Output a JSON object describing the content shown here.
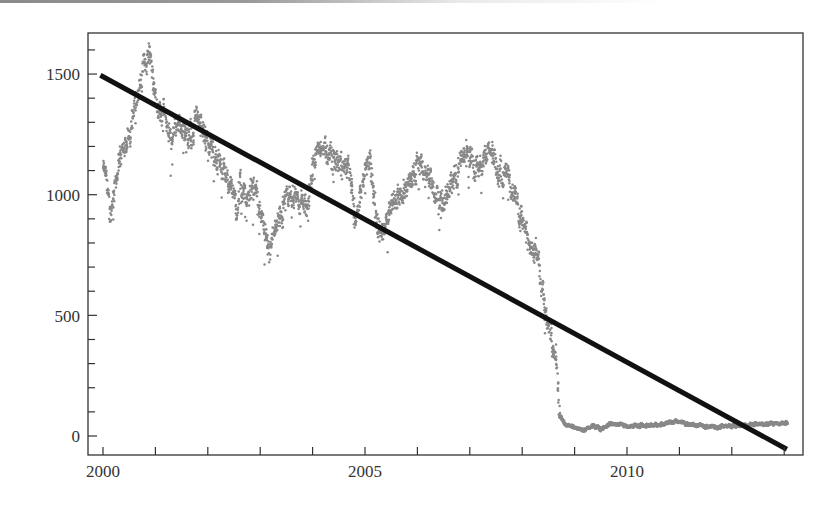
{
  "chart_data": {
    "type": "scatter",
    "title": "",
    "xlabel": "",
    "ylabel": "",
    "xlim": [
      1999.7,
      2013.3
    ],
    "ylim": [
      -90,
      1680
    ],
    "x_ticks": {
      "major": [
        2000,
        2005,
        2010
      ],
      "major_labels": [
        "2000",
        "2005",
        "2010"
      ],
      "minor": [
        2000,
        2001,
        2002,
        2003,
        2004,
        2005,
        2006,
        2007,
        2008,
        2009,
        2010,
        2011,
        2012,
        2013
      ]
    },
    "y_ticks": {
      "major": [
        0,
        500,
        1000,
        1500
      ],
      "major_labels": [
        "0",
        "500",
        "1000",
        "1500"
      ],
      "minor": [
        0,
        100,
        200,
        300,
        400,
        500,
        600,
        700,
        800,
        900,
        1000,
        1100,
        1200,
        1300,
        1400,
        1500,
        1600
      ]
    },
    "grid": false,
    "legend": null,
    "series": [
      {
        "name": "observed",
        "kind": "scatter",
        "color": "#888888",
        "x": [
          2000.0,
          2000.08,
          2000.13,
          2000.19,
          2000.29,
          2000.46,
          2000.55,
          2000.61,
          2000.71,
          2000.8,
          2000.9,
          2000.95,
          2001.03,
          2001.18,
          2001.28,
          2001.43,
          2001.56,
          2001.7,
          2001.76,
          2001.89,
          2002.04,
          2002.18,
          2002.29,
          2002.42,
          2002.56,
          2002.61,
          2002.75,
          2002.84,
          2003.0,
          2003.15,
          2003.38,
          2003.57,
          2003.76,
          2003.91,
          2004.01,
          2004.24,
          2004.39,
          2004.58,
          2004.71,
          2004.81,
          2004.96,
          2005.1,
          2005.19,
          2005.29,
          2005.44,
          2005.53,
          2005.73,
          2005.86,
          2005.99,
          2006.11,
          2006.28,
          2006.37,
          2006.49,
          2006.62,
          2006.76,
          2006.87,
          2006.97,
          2007.14,
          2007.23,
          2007.35,
          2007.44,
          2007.54,
          2007.67,
          2007.73,
          2007.81,
          2007.9,
          2008.02,
          2008.15,
          2008.28,
          2008.38,
          2008.47,
          2008.57,
          2008.66,
          2008.72,
          2008.82,
          2009.16,
          2009.35,
          2009.52,
          2009.68,
          2010.06,
          2010.44,
          2010.97,
          2011.26,
          2011.72,
          2012.21,
          2012.67,
          2013.07
        ],
        "y": [
          1100,
          1050,
          900,
          1000,
          1130,
          1230,
          1290,
          1370,
          1460,
          1550,
          1600,
          1520,
          1380,
          1330,
          1230,
          1310,
          1260,
          1220,
          1330,
          1280,
          1200,
          1150,
          1100,
          1050,
          950,
          1030,
          960,
          1040,
          940,
          740,
          900,
          1000,
          970,
          940,
          1150,
          1200,
          1150,
          1120,
          1090,
          900,
          1060,
          1150,
          920,
          840,
          900,
          980,
          1000,
          1080,
          1120,
          1100,
          1060,
          990,
          960,
          1030,
          1100,
          1160,
          1180,
          1110,
          1140,
          1180,
          1170,
          1090,
          1110,
          1140,
          1020,
          950,
          900,
          760,
          780,
          620,
          490,
          410,
          320,
          90,
          50,
          25,
          45,
          28,
          52,
          38,
          45,
          58,
          45,
          38,
          45,
          50,
          54
        ]
      },
      {
        "name": "linear trend",
        "kind": "line",
        "color": "#111111",
        "x": [
          1999.95,
          2013.05
        ],
        "y": [
          1495,
          -55
        ]
      }
    ]
  },
  "axis_labels": {
    "x": [
      "2000",
      "2005",
      "2010"
    ],
    "y": [
      "0",
      "500",
      "1000",
      "1500"
    ]
  }
}
